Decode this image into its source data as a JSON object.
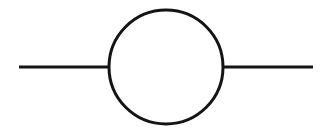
{
  "canvas": {
    "width": 327,
    "height": 133,
    "background_color": "#ffffff"
  },
  "diagram": {
    "name": "one-loop self-energy diagram",
    "type": "line-and-circle schematic",
    "stroke_color": "#141414",
    "stroke_width": 3,
    "elements": {
      "left_line": {
        "label": "left incoming line",
        "x1": 19,
        "y1": 67,
        "x2": 110,
        "y2": 67
      },
      "right_line": {
        "label": "right outgoing line",
        "x1": 222,
        "y1": 67,
        "x2": 313,
        "y2": 67
      },
      "loop": {
        "label": "loop circle",
        "cx": 166,
        "cy": 67,
        "r": 57,
        "fill": "none"
      }
    }
  }
}
